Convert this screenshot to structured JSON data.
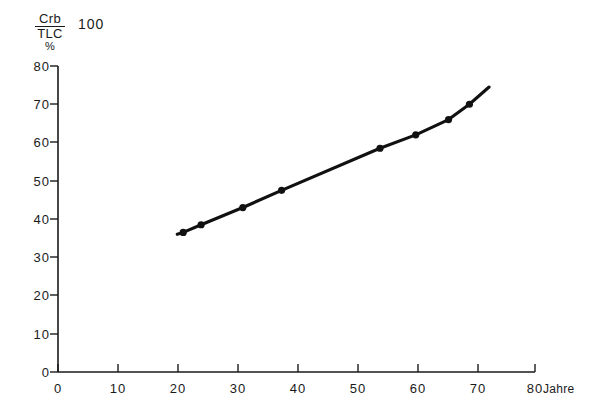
{
  "chart_data": {
    "type": "line",
    "title": "",
    "subtitle": "",
    "ylabel_numerator": "Crb",
    "ylabel_denominator": "TLC",
    "ylabel_unit": "%",
    "ylabel_top_value": "100",
    "xlabel": "Jahre",
    "ylim": [
      0,
      80
    ],
    "xlim": [
      0,
      80
    ],
    "yticks": [
      0,
      10,
      20,
      30,
      40,
      50,
      60,
      70,
      80
    ],
    "ytick_labels": [
      "0",
      "10",
      "20",
      "30",
      "40",
      "50",
      "60",
      "70",
      "80"
    ],
    "xticks": [
      0,
      10,
      20,
      30,
      40,
      50,
      60,
      70,
      80
    ],
    "xtick_labels": [
      "0",
      "10",
      "20",
      "30",
      "40",
      "50",
      "60",
      "70",
      "80"
    ],
    "grid": false,
    "legend": null,
    "marker": "filled-circle",
    "line_color": "#111111",
    "x": [
      21,
      24,
      31,
      37.5,
      54,
      60,
      65.5,
      69
    ],
    "values": [
      36.5,
      38.5,
      43,
      47.5,
      58.5,
      62,
      66,
      70
    ],
    "line_extends_to_x": 72.3,
    "line_extends_to_y": 74.5,
    "line_starts_at_x": 20,
    "line_starts_at_y": 36
  }
}
